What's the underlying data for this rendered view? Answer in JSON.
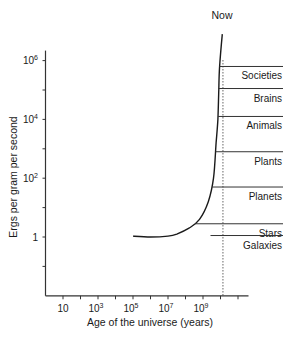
{
  "chart_data": {
    "type": "line",
    "title": "",
    "xlabel": "Age of the universe (years)",
    "ylabel": "Ergs per gram per second",
    "x_scale": "log10",
    "y_scale": "log10",
    "xlim_log10": [
      0,
      11.6
    ],
    "ylim_log10": [
      -2,
      6
    ],
    "x_ticks_log10": [
      0,
      1,
      2,
      3,
      4,
      5,
      6,
      7,
      8,
      9,
      10,
      11
    ],
    "x_tick_labels": [
      {
        "pos": 1,
        "base": "10",
        "exp": ""
      },
      {
        "pos": 3,
        "base": "10",
        "exp": "3"
      },
      {
        "pos": 5,
        "base": "10",
        "exp": "5"
      },
      {
        "pos": 7,
        "base": "10",
        "exp": "7"
      },
      {
        "pos": 9,
        "base": "10",
        "exp": "9"
      }
    ],
    "y_ticks_log10": [
      -2,
      -1,
      0,
      1,
      2,
      3,
      4,
      5,
      6
    ],
    "y_tick_labels": [
      {
        "pos": 0,
        "base": "1",
        "exp": ""
      },
      {
        "pos": 2,
        "base": "10",
        "exp": "2"
      },
      {
        "pos": 4,
        "base": "10",
        "exp": "4"
      },
      {
        "pos": 6,
        "base": "10",
        "exp": "6"
      }
    ],
    "grid": false,
    "series": [
      {
        "name": "Energy rate density",
        "points_log10": [
          [
            5.0,
            0.03
          ],
          [
            6.0,
            0.0
          ],
          [
            7.0,
            0.03
          ],
          [
            7.5,
            0.1
          ],
          [
            8.2,
            0.3
          ],
          [
            8.8,
            0.6
          ],
          [
            9.3,
            1.2
          ],
          [
            9.6,
            2.0
          ],
          [
            9.75,
            3.2
          ],
          [
            9.85,
            4.0
          ],
          [
            9.9,
            5.0
          ],
          [
            9.95,
            5.8
          ],
          [
            10.1,
            6.9
          ]
        ]
      }
    ],
    "annotations": [
      {
        "label": "Now",
        "type": "vertical-dotted-line",
        "x_log10": 10.14
      },
      {
        "label": "Societies",
        "y_log10": 5.8
      },
      {
        "label": "Brains",
        "y_log10": 5.05
      },
      {
        "label": "Animals",
        "y_log10": 4.1
      },
      {
        "label": "Plants",
        "y_log10": 2.9
      },
      {
        "label": "Planets",
        "y_log10": 1.7
      },
      {
        "label": "Stars",
        "y_log10": 0.45
      },
      {
        "label": "Galaxies",
        "y_log10": 0.05
      }
    ]
  }
}
